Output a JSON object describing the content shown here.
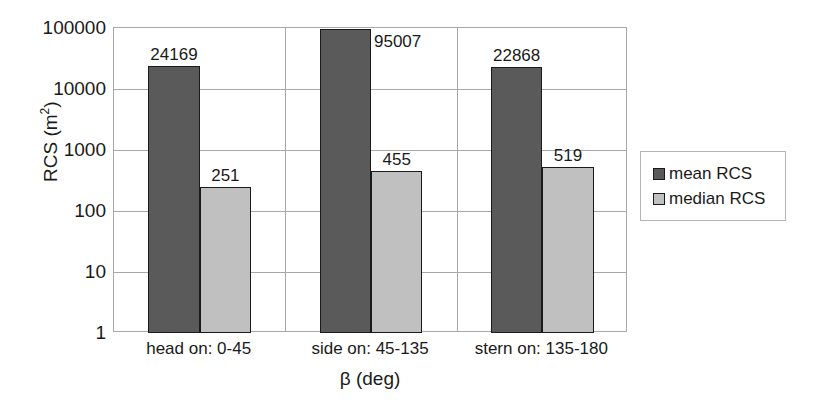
{
  "chart_data": {
    "type": "bar",
    "title": "",
    "subtitle": "",
    "xlabel": "β (deg)",
    "ylabel": "RCS (m²)",
    "ylabel_main": "RCS (m",
    "ylabel_sup": "2",
    "ylabel_tail": ")",
    "yscale": "log",
    "ylim": [
      1,
      100000
    ],
    "grid": true,
    "legend_position": "right",
    "categories": [
      "head on: 0-45",
      "side on: 45-135",
      "stern on: 135-180"
    ],
    "ytick_labels": [
      "100000",
      "10000",
      "1000",
      "100",
      "10",
      "1"
    ],
    "ytick_values": [
      100000,
      10000,
      1000,
      100,
      10,
      1
    ],
    "series": [
      {
        "name": "mean RCS",
        "color": "#5a5a5a",
        "values": [
          24169,
          95007,
          22868
        ],
        "labels": [
          "24169",
          "95007",
          "22868"
        ]
      },
      {
        "name": "median RCS",
        "color": "#c0c0c0",
        "values": [
          251,
          455,
          519
        ],
        "labels": [
          "251",
          "455",
          "519"
        ]
      }
    ]
  },
  "legend": {
    "entries": [
      {
        "label": "mean RCS",
        "swatch": "mean"
      },
      {
        "label": "median RCS",
        "swatch": "median"
      }
    ]
  },
  "colors": {
    "mean": "#5a5a5a",
    "median": "#c0c0c0",
    "axis": "#a8a8a8",
    "text": "#1a1a1a",
    "background": "#ffffff"
  }
}
